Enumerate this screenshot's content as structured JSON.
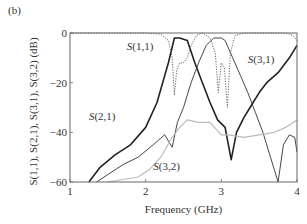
{
  "panel_label": "(b)",
  "chart_data": {
    "type": "line",
    "title": "",
    "xlabel": "Frequency (GHz)",
    "ylabel": "S(1,1), S(2,1), S(3,1), S(3,2) (dB)",
    "xlim": [
      1,
      4
    ],
    "ylim": [
      -60,
      0
    ],
    "xticks": [
      1,
      2,
      3,
      4
    ],
    "yticks": [
      0,
      -20,
      -40,
      -60
    ],
    "grid": false,
    "legend": "inline labels",
    "series": [
      {
        "name": "S(2,1)",
        "style": "solid-bold",
        "color": "#222222",
        "label_pos": [
          1.25,
          -35
        ],
        "x": [
          1.25,
          1.4,
          1.6,
          1.8,
          2.0,
          2.15,
          2.3,
          2.38,
          2.45,
          2.55,
          2.65,
          2.75,
          2.85,
          2.95,
          3.05,
          3.13,
          3.2,
          3.3,
          3.4,
          3.5,
          3.6,
          3.75,
          3.9,
          4.0
        ],
        "y": [
          -60,
          -54,
          -49,
          -45,
          -38,
          -28,
          -12,
          -2,
          -2,
          -3,
          -12,
          -20,
          -28,
          -35,
          -38,
          -51,
          -40,
          -34,
          -29,
          -24,
          -20,
          -16,
          -10,
          -5
        ]
      },
      {
        "name": "S(3,1)",
        "style": "solid-thin",
        "color": "#333333",
        "label_pos": [
          3.35,
          -12
        ],
        "x": [
          1.35,
          1.5,
          1.7,
          1.9,
          2.1,
          2.25,
          2.35,
          2.42,
          2.5,
          2.6,
          2.7,
          2.8,
          2.9,
          3.0,
          3.05,
          3.15,
          3.25,
          3.35,
          3.45,
          3.55,
          3.65,
          3.75,
          3.82,
          3.9,
          3.97,
          4.0
        ],
        "y": [
          -60,
          -57,
          -53,
          -50,
          -45,
          -41,
          -46,
          -36,
          -30,
          -20,
          -12,
          -5,
          -2,
          -2,
          -3,
          -10,
          -17,
          -24,
          -32,
          -40,
          -50,
          -60,
          -45,
          -41,
          -42,
          -48
        ]
      },
      {
        "name": "S(3,2)",
        "style": "solid-light",
        "color": "#bbbbbb",
        "label_pos": [
          2.1,
          -55
        ],
        "x": [
          1.5,
          1.7,
          1.9,
          2.05,
          2.2,
          2.35,
          2.45,
          2.55,
          2.7,
          2.85,
          3.0,
          3.1,
          3.3,
          3.5,
          3.7,
          3.85,
          4.0
        ],
        "y": [
          -60,
          -59,
          -58,
          -55,
          -50,
          -42,
          -38,
          -35,
          -36,
          -36,
          -41,
          -41,
          -42,
          -41,
          -40,
          -38,
          -35
        ]
      },
      {
        "name": "S(1,1)",
        "style": "dotted",
        "color": "#555555",
        "label_pos": [
          1.75,
          -7
        ],
        "x": [
          1.0,
          1.5,
          2.0,
          2.2,
          2.3,
          2.35,
          2.38,
          2.41,
          2.45,
          2.5,
          2.55,
          2.6,
          2.67,
          2.75,
          2.85,
          2.92,
          2.96,
          3.0,
          3.04,
          3.08,
          3.12,
          3.18,
          3.3,
          3.5,
          3.7,
          3.85,
          3.95,
          4.0
        ],
        "y": [
          0,
          0,
          0,
          -0.5,
          -3,
          -10,
          -25,
          -15,
          -12,
          -12,
          -10,
          -5,
          -1,
          0,
          -2,
          -8,
          -24,
          -12,
          -14,
          -30,
          -8,
          -1,
          0,
          0,
          0,
          0,
          -1,
          -3
        ]
      }
    ]
  }
}
